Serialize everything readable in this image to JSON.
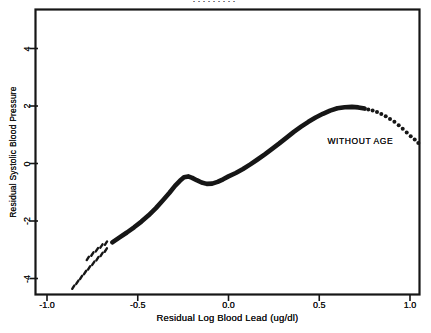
{
  "figure": {
    "illegible_top_fragment": "·········",
    "background": "#ffffff",
    "ink_color": "#161616"
  },
  "chart_data": {
    "type": "scatter",
    "title": "",
    "xlabel": "Residual Log Blood Lead (ug/dl)",
    "ylabel": "Residual Systolic Blood Pressure",
    "xlim": [
      -1.06,
      1.06
    ],
    "ylim": [
      -4.57,
      5.36
    ],
    "grid": false,
    "frame": true,
    "x_ticks": {
      "values": [
        -1.0,
        -0.5,
        0.0,
        0.5,
        1.0
      ],
      "labels": [
        "-1.0",
        "-0.5",
        "0.0",
        "0.5",
        "1.0"
      ]
    },
    "y_ticks": {
      "values": [
        4,
        2,
        0,
        -2,
        -4
      ],
      "labels": [
        "4",
        "2",
        "0",
        "-2",
        "-4"
      ]
    },
    "annotation": {
      "text": "WITHOUT AGE",
      "x": 0.545,
      "y": 0.8
    },
    "series": [
      {
        "name": "lowess-curve-leading-scatter",
        "style": "dashes",
        "points": [
          [
            -0.855,
            -4.3
          ],
          [
            -0.833,
            -4.13
          ],
          [
            -0.812,
            -3.96
          ],
          [
            -0.79,
            -3.79
          ],
          [
            -0.768,
            -3.63
          ],
          [
            -0.745,
            -3.47
          ],
          [
            -0.722,
            -3.31
          ],
          [
            -0.699,
            -3.16
          ],
          [
            -0.676,
            -3.01
          ],
          [
            -0.775,
            -3.3
          ],
          [
            -0.75,
            -3.15
          ],
          [
            -0.725,
            -3.0
          ],
          [
            -0.7,
            -2.87
          ],
          [
            -0.675,
            -2.77
          ]
        ]
      },
      {
        "name": "lowess-curve-dense-band",
        "style": "thick-line",
        "points": [
          [
            -0.64,
            -2.74
          ],
          [
            -0.6,
            -2.57
          ],
          [
            -0.56,
            -2.4
          ],
          [
            -0.52,
            -2.22
          ],
          [
            -0.48,
            -2.02
          ],
          [
            -0.44,
            -1.8
          ],
          [
            -0.4,
            -1.55
          ],
          [
            -0.36,
            -1.27
          ],
          [
            -0.325,
            -1.02
          ],
          [
            -0.295,
            -0.78
          ],
          [
            -0.268,
            -0.6
          ],
          [
            -0.245,
            -0.48
          ],
          [
            -0.222,
            -0.45
          ],
          [
            -0.2,
            -0.5
          ],
          [
            -0.175,
            -0.58
          ],
          [
            -0.148,
            -0.66
          ],
          [
            -0.12,
            -0.71
          ],
          [
            -0.09,
            -0.7
          ],
          [
            -0.06,
            -0.64
          ],
          [
            -0.03,
            -0.55
          ],
          [
            0.0,
            -0.45
          ],
          [
            0.04,
            -0.33
          ],
          [
            0.08,
            -0.19
          ],
          [
            0.12,
            -0.03
          ],
          [
            0.16,
            0.14
          ],
          [
            0.2,
            0.32
          ],
          [
            0.24,
            0.51
          ],
          [
            0.28,
            0.7
          ],
          [
            0.32,
            0.9
          ],
          [
            0.36,
            1.1
          ],
          [
            0.4,
            1.28
          ],
          [
            0.44,
            1.45
          ],
          [
            0.48,
            1.6
          ],
          [
            0.52,
            1.73
          ],
          [
            0.56,
            1.84
          ],
          [
            0.6,
            1.92
          ],
          [
            0.64,
            1.96
          ],
          [
            0.68,
            1.97
          ],
          [
            0.715,
            1.95
          ],
          [
            0.75,
            1.91
          ]
        ]
      },
      {
        "name": "lowess-curve-trailing-scatter",
        "style": "dots",
        "points": [
          [
            0.77,
            1.88
          ],
          [
            0.794,
            1.84
          ],
          [
            0.818,
            1.79
          ],
          [
            0.842,
            1.72
          ],
          [
            0.866,
            1.64
          ],
          [
            0.89,
            1.55
          ],
          [
            0.914,
            1.45
          ],
          [
            0.938,
            1.33
          ],
          [
            0.96,
            1.21
          ],
          [
            0.982,
            1.08
          ],
          [
            1.004,
            0.95
          ],
          [
            1.026,
            0.83
          ],
          [
            1.046,
            0.71
          ]
        ]
      }
    ]
  }
}
